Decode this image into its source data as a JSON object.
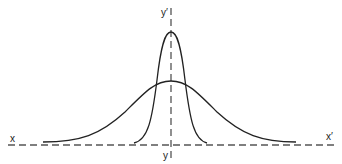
{
  "diagram": {
    "labels": {
      "x_left": "x",
      "x_right": "x′",
      "y_top": "y′",
      "y_bottom": "y"
    },
    "curves": [
      {
        "name": "narrow-bell-curve",
        "peak_height": "tall",
        "spread": "narrow"
      },
      {
        "name": "wide-bell-curve",
        "peak_height": "low",
        "spread": "wide"
      }
    ],
    "colors": {
      "stroke": "#222222",
      "axis": "#555555"
    }
  }
}
